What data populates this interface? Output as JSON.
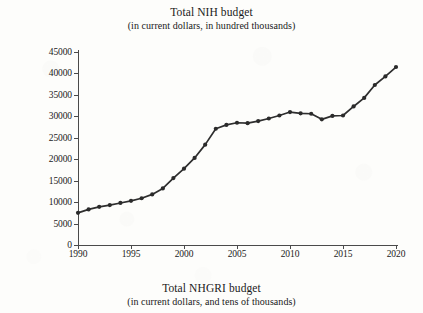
{
  "title": {
    "main": "Total NIH budget",
    "sub": "(in current dollars, in hundred thousands)"
  },
  "caption": {
    "main": "Total NHGRI budget",
    "sub": "(in current dollars, and tens of thousands)"
  },
  "colors": {
    "line": "#2e2e2e",
    "marker": "#2b2b2b",
    "axis": "#4a4a4a",
    "paper": "#fdfdfb",
    "text": "#1a1a1a"
  },
  "chart_data": {
    "type": "line",
    "title": "Total NIH budget",
    "subtitle": "(in current dollars, in hundred thousands)",
    "xlabel": "",
    "ylabel": "",
    "xlim": [
      1990,
      2020
    ],
    "ylim": [
      0,
      45000
    ],
    "grid": false,
    "legend": null,
    "xticks": [
      1990,
      1995,
      2000,
      2005,
      2010,
      2015,
      2020
    ],
    "yticks": [
      0,
      5000,
      10000,
      15000,
      20000,
      25000,
      30000,
      35000,
      40000,
      45000
    ],
    "markers": "circle",
    "series": [
      {
        "name": "Total NIH budget",
        "x": [
          1990,
          1991,
          1992,
          1993,
          1994,
          1995,
          1996,
          1997,
          1998,
          1999,
          2000,
          2001,
          2002,
          2003,
          2004,
          2005,
          2006,
          2007,
          2008,
          2009,
          2010,
          2011,
          2012,
          2013,
          2014,
          2015,
          2016,
          2017,
          2018,
          2019,
          2020
        ],
        "values": [
          7500,
          8300,
          8900,
          9300,
          9800,
          10300,
          10900,
          11800,
          13200,
          15600,
          17800,
          20300,
          23400,
          27100,
          28000,
          28500,
          28400,
          28900,
          29500,
          30200,
          31000,
          30700,
          30600,
          29300,
          30100,
          30200,
          32300,
          34300,
          37300,
          39300,
          41500
        ]
      }
    ]
  }
}
